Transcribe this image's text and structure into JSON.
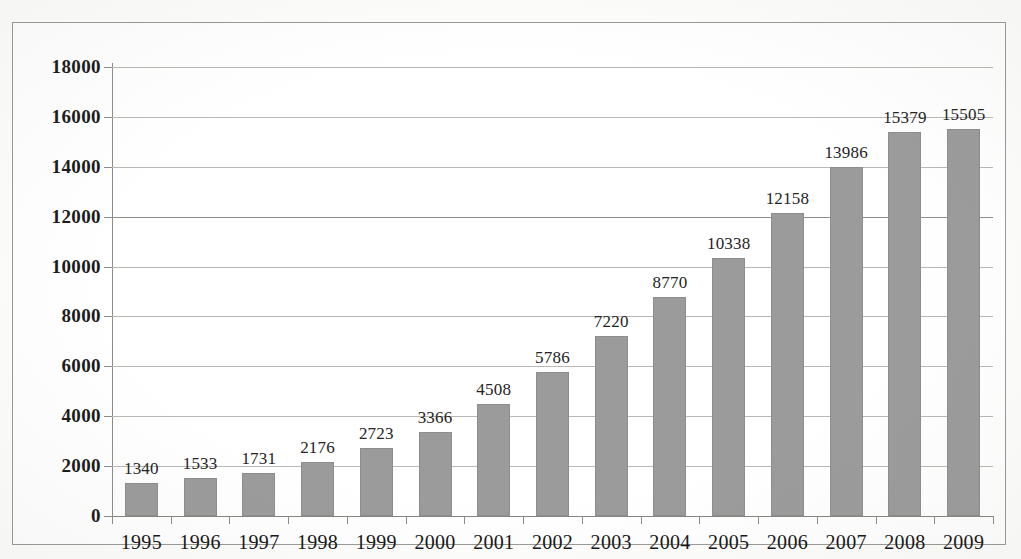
{
  "chart_data": {
    "type": "bar",
    "title": "",
    "subtitle": "",
    "xlabel": "",
    "ylabel": "",
    "categories": [
      "1995",
      "1996",
      "1997",
      "1998",
      "1999",
      "2000",
      "2001",
      "2002",
      "2003",
      "2004",
      "2005",
      "2006",
      "2007",
      "2008",
      "2009"
    ],
    "values": [
      1340,
      1533,
      1731,
      2176,
      2723,
      3366,
      4508,
      5786,
      7220,
      8770,
      10338,
      12158,
      13986,
      15379,
      15505
    ],
    "data_labels": [
      "1340",
      "1533",
      "1731",
      "2176",
      "2723",
      "3366",
      "4508",
      "5786",
      "7220",
      "8770",
      "10338",
      "12158",
      "13986",
      "15379",
      "15505"
    ],
    "ylim": [
      0,
      18000
    ],
    "ytick_values": [
      0,
      2000,
      4000,
      6000,
      8000,
      10000,
      12000,
      14000,
      16000,
      18000
    ],
    "ytick_labels": [
      "0",
      "2000",
      "4000",
      "6000",
      "8000",
      "10000",
      "12000",
      "14000",
      "16000",
      "18000"
    ],
    "grid": true,
    "grid_axis": "y",
    "legend": false,
    "legend_position": "none",
    "series": [
      {
        "name": "",
        "color": "#9b9b9b",
        "values": [
          1340,
          1533,
          1731,
          2176,
          2723,
          3366,
          4508,
          5786,
          7220,
          8770,
          10338,
          12158,
          13986,
          15379,
          15505
        ]
      }
    ],
    "colors": {
      "bar_fill": "#9b9b9b",
      "gridline": "#b9b8b3",
      "axis": "#86857f",
      "frame": "#9a9a94",
      "text": "#1b1b1b",
      "background": "#ffffff"
    }
  }
}
